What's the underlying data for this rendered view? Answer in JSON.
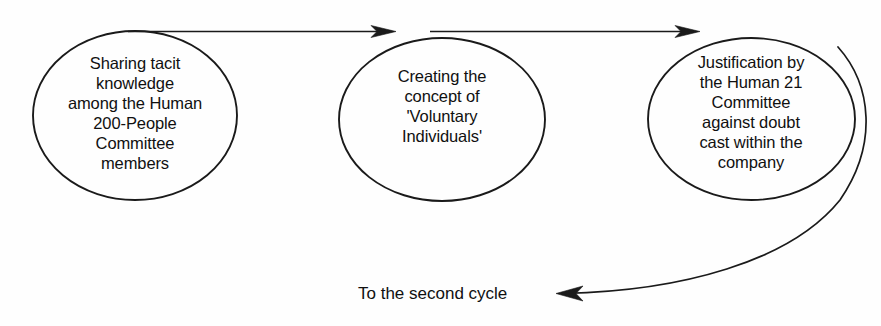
{
  "diagram": {
    "type": "process-cycle-flow",
    "background_color": "#fefefe",
    "stroke_color": "#1a1a1a",
    "text_color": "#101010",
    "nodes": [
      {
        "id": "node-1",
        "shape": "ellipse",
        "text": "Sharing tacit\nknowledge\namong the Human\n200-People\nCommittee\nmembers"
      },
      {
        "id": "node-2",
        "shape": "ellipse",
        "text": "Creating the\nconcept of\n'Voluntary\nIndividuals'"
      },
      {
        "id": "node-3",
        "shape": "ellipse",
        "text": "Justification by\nthe Human 21\nCommittee\nagainst doubt\ncast within the\ncompany"
      }
    ],
    "connectors": [
      {
        "id": "arrow-1",
        "from": "node-1",
        "to": "node-2",
        "style": "straight-arrow"
      },
      {
        "id": "arrow-2",
        "from": "node-2",
        "to": "node-3",
        "style": "straight-arrow"
      },
      {
        "id": "return-arrow",
        "from": "node-3",
        "to": "return-caption",
        "style": "curved-arrow"
      }
    ],
    "return_caption": "To the second cycle"
  }
}
